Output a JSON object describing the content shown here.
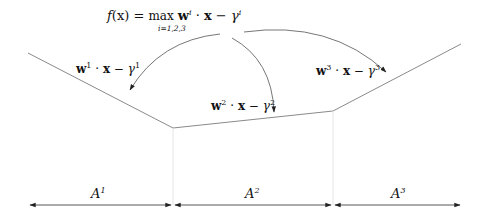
{
  "title": {
    "f": "f",
    "x_paren": "(x)",
    "eq": " = ",
    "max": "max",
    "sub": "i=1,2,3",
    "w": "w",
    "sup_i": "i",
    "dot": " · ",
    "x": "x",
    "minus": " − ",
    "gamma": "γ",
    "gamma_sup": "i"
  },
  "pieces": [
    {
      "w": "w",
      "sup": "1",
      "dot": " · ",
      "x": "x",
      "minus": " − ",
      "gamma": "γ",
      "gsup": "1"
    },
    {
      "w": "w",
      "sup": "2",
      "dot": " · ",
      "x": "x",
      "minus": " − ",
      "gamma": "γ",
      "gsup": "2"
    },
    {
      "w": "w",
      "sup": "3",
      "dot": " · ",
      "x": "x",
      "minus": " − ",
      "gamma": "γ",
      "gsup": "3"
    }
  ],
  "regions": [
    {
      "label": "A",
      "sup": "1"
    },
    {
      "label": "A",
      "sup": "2"
    },
    {
      "label": "A",
      "sup": "3"
    }
  ],
  "colors": {
    "line": "#8a8a8a",
    "arrow": "#333333",
    "guide": "#e4e4e4"
  }
}
